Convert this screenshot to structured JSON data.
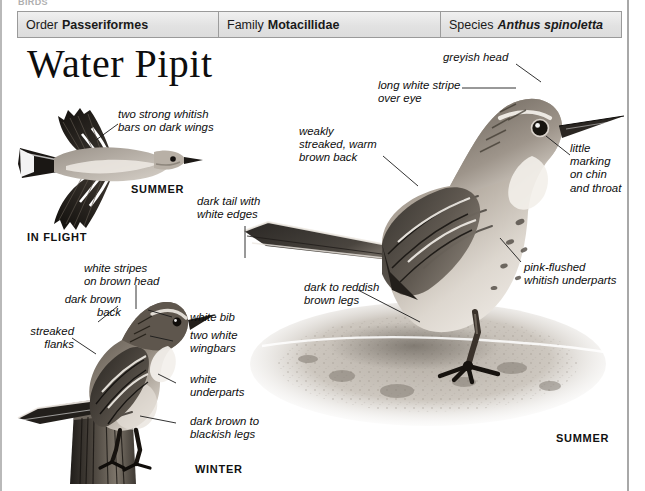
{
  "page": {
    "running_head": "BIRDS",
    "title": "Water Pipit"
  },
  "taxonomy": [
    {
      "key": "Order",
      "value": "Passeriformes",
      "italic": false
    },
    {
      "key": "Family",
      "value": "Motacillidae",
      "italic": false
    },
    {
      "key": "Species",
      "value": "Anthus spinoletta",
      "italic": true
    }
  ],
  "captions": {
    "in_flight": "IN FLIGHT",
    "summer_flight": "SUMMER",
    "winter": "WINTER",
    "summer_main": "SUMMER"
  },
  "annotations": {
    "wingbars_flight": "two strong whitish\nbars on dark wings",
    "dark_tail": "dark tail with\nwhite edges",
    "weak_streaks": "weakly\nstreaked, warm\nbrown back",
    "greyish_head": "greyish head",
    "eye_stripe": "long white stripe\nover eye",
    "chin_throat": "little\nmarking\non chin\nand throat",
    "underparts_pink": "pink-flushed\nwhitish underparts",
    "legs_main": "dark to reddish\nbrown legs",
    "head_stripes_winter": "white stripes\non brown head",
    "dark_back_winter": "dark brown\nback",
    "streaked_flanks": "streaked\nflanks",
    "white_bib": "white bib",
    "two_wingbars": "two white\nwingbars",
    "white_underparts": "white\nunderparts",
    "legs_winter": "dark brown to\nblackish legs"
  },
  "colors": {
    "bar_fill": "#e4e4e4",
    "bar_border": "#9a9a9a",
    "ink": "#111111",
    "plumage_dark": "#2e2b28",
    "plumage_mid": "#7b736a",
    "plumage_light": "#cfc8bf",
    "ground": "#cfc9c1"
  }
}
